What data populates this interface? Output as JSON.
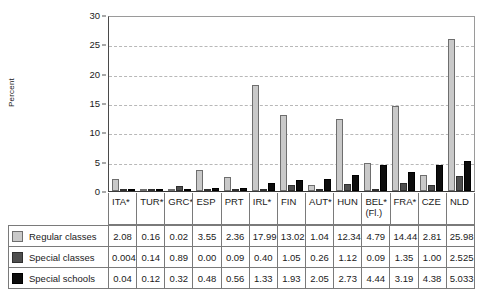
{
  "chart_data": {
    "type": "bar",
    "title": "",
    "xlabel": "",
    "ylabel": "Percent",
    "ylim": [
      0,
      30
    ],
    "yticks": [
      0,
      5,
      10,
      15,
      20,
      25,
      30
    ],
    "grid": true,
    "legend_position": "table-left",
    "categories": [
      "ITA*",
      "TUR*",
      "GRC*",
      "ESP",
      "PRT",
      "IRL*",
      "FIN",
      "AUT*",
      "HUN",
      "BEL*",
      "FRA*",
      "CZE",
      "NLD"
    ],
    "category_sublabels": [
      "",
      "",
      "",
      "",
      "",
      "",
      "",
      "",
      "",
      "(Fl.)",
      "",
      "",
      ""
    ],
    "series": [
      {
        "name": "Regular classes",
        "color": "#c9c9c9",
        "values": [
          2.08,
          0.16,
          0.02,
          3.55,
          2.36,
          17.99,
          13.02,
          1.04,
          12.34,
          4.79,
          14.44,
          2.81,
          25.98
        ],
        "labels": [
          "2.08",
          "0.16",
          "0.02",
          "3.55",
          "2.36",
          "17.99",
          "13.02",
          "1.04",
          "12.34",
          "4.79",
          "14.44",
          "2.81",
          "25.98"
        ]
      },
      {
        "name": "Special classes",
        "color": "#4f4f4f",
        "values": [
          0.004,
          0.14,
          0.89,
          0.0,
          0.09,
          0.4,
          1.05,
          0.26,
          1.12,
          0.09,
          1.35,
          1.0,
          2.525
        ],
        "labels": [
          "0.004",
          "0.14",
          "0.89",
          "0.00",
          "0.09",
          "0.40",
          "1.05",
          "0.26",
          "1.12",
          "0.09",
          "1.35",
          "1.00",
          "2.525"
        ]
      },
      {
        "name": "Special schools",
        "color": "#0d0d0d",
        "values": [
          0.04,
          0.12,
          0.32,
          0.48,
          0.56,
          1.33,
          1.93,
          2.05,
          2.73,
          4.44,
          3.19,
          4.38,
          5.033
        ],
        "labels": [
          "0.04",
          "0.12",
          "0.32",
          "0.48",
          "0.56",
          "1.33",
          "1.93",
          "2.05",
          "2.73",
          "4.44",
          "3.19",
          "4.38",
          "5.033"
        ]
      }
    ]
  }
}
